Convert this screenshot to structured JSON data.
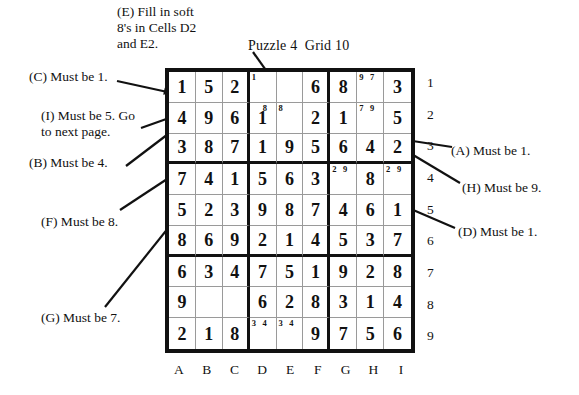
{
  "title": "Puzzle 4  Grid 10",
  "grid": {
    "column_labels": [
      "A",
      "B",
      "C",
      "D",
      "E",
      "F",
      "G",
      "H",
      "I"
    ],
    "row_labels": [
      "1",
      "2",
      "3",
      "4",
      "5",
      "6",
      "7",
      "8",
      "9"
    ],
    "rows": [
      [
        {
          "value": "1",
          "marks": ""
        },
        {
          "value": "5",
          "marks": ""
        },
        {
          "value": "2",
          "marks": ""
        },
        {
          "value": "",
          "marks": "1"
        },
        {
          "value": "",
          "marks": ""
        },
        {
          "value": "6",
          "marks": ""
        },
        {
          "value": "8",
          "marks": ""
        },
        {
          "value": "",
          "marks": "9 7"
        },
        {
          "value": "3",
          "marks": ""
        }
      ],
      [
        {
          "value": "4",
          "marks": ""
        },
        {
          "value": "9",
          "marks": ""
        },
        {
          "value": "6",
          "marks": ""
        },
        {
          "value": "1",
          "marks": "8"
        },
        {
          "value": "",
          "marks": "8"
        },
        {
          "value": "2",
          "marks": ""
        },
        {
          "value": "1",
          "marks": ""
        },
        {
          "value": "",
          "marks": "7 9"
        },
        {
          "value": "5",
          "marks": ""
        }
      ],
      [
        {
          "value": "3",
          "marks": ""
        },
        {
          "value": "8",
          "marks": ""
        },
        {
          "value": "7",
          "marks": ""
        },
        {
          "value": "1",
          "marks": ""
        },
        {
          "value": "9",
          "marks": ""
        },
        {
          "value": "5",
          "marks": ""
        },
        {
          "value": "6",
          "marks": ""
        },
        {
          "value": "4",
          "marks": ""
        },
        {
          "value": "2",
          "marks": ""
        }
      ],
      [
        {
          "value": "7",
          "marks": ""
        },
        {
          "value": "4",
          "marks": ""
        },
        {
          "value": "1",
          "marks": ""
        },
        {
          "value": "5",
          "marks": ""
        },
        {
          "value": "6",
          "marks": ""
        },
        {
          "value": "3",
          "marks": ""
        },
        {
          "value": "",
          "marks": "2 9"
        },
        {
          "value": "8",
          "marks": ""
        },
        {
          "value": "",
          "marks": "2 9"
        }
      ],
      [
        {
          "value": "5",
          "marks": ""
        },
        {
          "value": "2",
          "marks": ""
        },
        {
          "value": "3",
          "marks": ""
        },
        {
          "value": "9",
          "marks": ""
        },
        {
          "value": "8",
          "marks": ""
        },
        {
          "value": "7",
          "marks": ""
        },
        {
          "value": "4",
          "marks": ""
        },
        {
          "value": "6",
          "marks": ""
        },
        {
          "value": "1",
          "marks": ""
        }
      ],
      [
        {
          "value": "8",
          "marks": ""
        },
        {
          "value": "6",
          "marks": ""
        },
        {
          "value": "9",
          "marks": ""
        },
        {
          "value": "2",
          "marks": ""
        },
        {
          "value": "1",
          "marks": ""
        },
        {
          "value": "4",
          "marks": ""
        },
        {
          "value": "5",
          "marks": ""
        },
        {
          "value": "3",
          "marks": ""
        },
        {
          "value": "7",
          "marks": ""
        }
      ],
      [
        {
          "value": "6",
          "marks": ""
        },
        {
          "value": "3",
          "marks": ""
        },
        {
          "value": "4",
          "marks": ""
        },
        {
          "value": "7",
          "marks": ""
        },
        {
          "value": "5",
          "marks": ""
        },
        {
          "value": "1",
          "marks": ""
        },
        {
          "value": "9",
          "marks": ""
        },
        {
          "value": "2",
          "marks": ""
        },
        {
          "value": "8",
          "marks": ""
        }
      ],
      [
        {
          "value": "9",
          "marks": ""
        },
        {
          "value": "",
          "marks": ""
        },
        {
          "value": "",
          "marks": ""
        },
        {
          "value": "6",
          "marks": ""
        },
        {
          "value": "2",
          "marks": ""
        },
        {
          "value": "8",
          "marks": ""
        },
        {
          "value": "3",
          "marks": ""
        },
        {
          "value": "1",
          "marks": ""
        },
        {
          "value": "4",
          "marks": ""
        }
      ],
      [
        {
          "value": "2",
          "marks": ""
        },
        {
          "value": "1",
          "marks": ""
        },
        {
          "value": "8",
          "marks": ""
        },
        {
          "value": "",
          "marks": "3 4"
        },
        {
          "value": "",
          "marks": "3 4"
        },
        {
          "value": "9",
          "marks": ""
        },
        {
          "value": "7",
          "marks": ""
        },
        {
          "value": "5",
          "marks": ""
        },
        {
          "value": "6",
          "marks": ""
        }
      ]
    ]
  },
  "annotations": [
    {
      "id": "note-e",
      "text": "(E) Fill in soft\n8's in Cells D2\nand E2.",
      "left": 117,
      "top": 4,
      "align": "left"
    },
    {
      "id": "note-c",
      "text": "(C) Must be 1.",
      "left": 29,
      "top": 69,
      "align": "left"
    },
    {
      "id": "note-i",
      "text": "(I) Must be 5. Go\nto next page.",
      "left": 41,
      "top": 108,
      "align": "left"
    },
    {
      "id": "note-b",
      "text": "(B) Must be 4.",
      "left": 29,
      "top": 155,
      "align": "left"
    },
    {
      "id": "note-f",
      "text": "(F) Must be 8.",
      "left": 41,
      "top": 214,
      "align": "left"
    },
    {
      "id": "note-g",
      "text": "(G) Must be 7.",
      "left": 41,
      "top": 310,
      "align": "left"
    },
    {
      "id": "note-a",
      "text": "(A) Must be 1.",
      "left": 451,
      "top": 143,
      "align": "left"
    },
    {
      "id": "note-h",
      "text": "(H) Must be 9.",
      "left": 462,
      "top": 180,
      "align": "left"
    },
    {
      "id": "note-d",
      "text": "(D) Must be 1.",
      "left": 458,
      "top": 224,
      "align": "left"
    }
  ],
  "leader_lines": [
    {
      "id": "leader-e",
      "x1": 253,
      "y1": 52,
      "x2": 292,
      "y2": 107
    },
    {
      "id": "leader-c",
      "x1": 117,
      "y1": 81,
      "x2": 172,
      "y2": 93
    },
    {
      "id": "leader-b",
      "x1": 126,
      "y1": 166,
      "x2": 176,
      "y2": 128
    },
    {
      "id": "leader-i",
      "x1": 141,
      "y1": 128,
      "x2": 186,
      "y2": 112
    },
    {
      "id": "leader-f",
      "x1": 120,
      "y1": 210,
      "x2": 196,
      "y2": 160
    },
    {
      "id": "leader-g",
      "x1": 105,
      "y1": 307,
      "x2": 225,
      "y2": 157
    },
    {
      "id": "leader-a",
      "x1": 452,
      "y1": 147,
      "x2": 268,
      "y2": 119
    },
    {
      "id": "leader-h",
      "x1": 460,
      "y1": 183,
      "x2": 363,
      "y2": 125
    },
    {
      "id": "leader-d",
      "x1": 455,
      "y1": 228,
      "x2": 290,
      "y2": 157
    }
  ]
}
